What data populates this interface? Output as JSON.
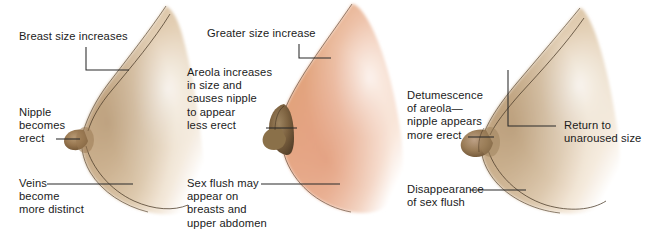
{
  "figure": {
    "background_color": "#ffffff",
    "text_color": "#1b1b1b",
    "leader_line_color": "#2a2a2a"
  },
  "panels": [
    {
      "id": "excitement-phase",
      "skin_tone_light": "#e8d3bb",
      "skin_tone_mid": "#cbb092",
      "skin_tone_dark": "#a98b68",
      "labels": {
        "top": "Breast size increases",
        "middle": "Nipple\nbecomes\nerect",
        "bottom": "Veins\nbecome\nmore distinct"
      }
    },
    {
      "id": "plateau-phase",
      "skin_tone_light": "#f4d9c6",
      "skin_tone_mid": "#e5a783",
      "skin_tone_dark": "#d08a63",
      "labels": {
        "top": "Greater size increase",
        "middle": "Areola increases\nin size and\ncauses nipple\nto appear\nless erect",
        "bottom": "Sex flush may\nappear on\nbreasts and\nupper abdomen"
      }
    },
    {
      "id": "resolution-phase",
      "skin_tone_light": "#e9d5bc",
      "skin_tone_mid": "#cdb293",
      "skin_tone_dark": "#a88c69",
      "labels": {
        "left_middle": "Detumescence\nof areola—\nnipple appears\nmore erect",
        "left_bottom": "Disappearance\nof sex flush",
        "right": "Return to\nunaroused size"
      }
    }
  ]
}
